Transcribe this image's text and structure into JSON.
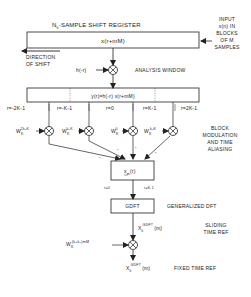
{
  "shift_register": {
    "title": "N",
    "title_sub": "h",
    "title_rest": "-SAMPLE SHIFT REGISTER",
    "content": "x(r+mM)"
  },
  "input_label": [
    "INPUT",
    "x(n) IN",
    "BLOCKS",
    "OF M",
    "SAMPLES"
  ],
  "direction_label": [
    "DIRECTION",
    "OF SHIFT"
  ],
  "window": {
    "input": "h(-r)",
    "label": "ANALYSIS WINDOW"
  },
  "windowed_block": {
    "content": "y(r)=h(-r) x(r+mM)"
  },
  "segments": [
    "r=-2K-1",
    "r=-K-1",
    "r=0",
    "r=K-1",
    "r=2K-1"
  ],
  "modulators": [
    {
      "base": "W",
      "sub": "K",
      "sup": "2k₀K"
    },
    {
      "base": "W",
      "sub": "K",
      "sup": "k₀K"
    },
    {
      "base": "W",
      "sub": "K",
      "sup": "0"
    },
    {
      "base": "W",
      "sub": "K",
      "sup": "-k₀K"
    }
  ],
  "block_mod_label": [
    "BLOCK",
    "MODULATION",
    "AND TIME",
    "ALIASING"
  ],
  "aliased_block": {
    "content_base": "x",
    "content_sub": "m",
    "content_arg": "(r)",
    "range_start": "r=0",
    "range_end": "r=K-1"
  },
  "gdft": {
    "label": "GDFT",
    "description": "GENERALIZED DFT"
  },
  "sliding": {
    "base": "X",
    "sub": "k",
    "sup": "GDFT",
    "arg": "(m)",
    "label": [
      "SLIDING",
      "TIME REF"
    ]
  },
  "time_ref_mod": {
    "base": "W",
    "sub": "K",
    "sup": "-(k+k₀)mM"
  },
  "fixed": {
    "base": "X",
    "sub": "k",
    "sup": "GDFT",
    "arg": "(m)",
    "label": "FIXED TIME REF"
  }
}
